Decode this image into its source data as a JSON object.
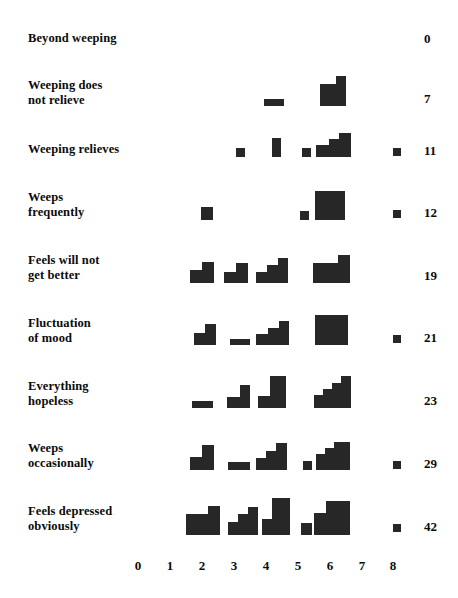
{
  "chart_data": {
    "type": "bar",
    "title": "",
    "subtitle": "",
    "xlabel": "",
    "ylabel": "",
    "xlim": [
      0,
      8
    ],
    "grid": false,
    "legend": null,
    "x_ticks": [
      "0",
      "1",
      "2",
      "3",
      "4",
      "5",
      "6",
      "7",
      "8"
    ],
    "categories": [
      "Beyond weeping",
      "Weeping does not relieve",
      "Weeping relieves",
      "Weeps frequently",
      "Feels will not get better",
      "Fluctuation of mood",
      "Everything hopeless",
      "Weeps occasionally",
      "Feels depressed obviously"
    ],
    "totals": [
      0,
      7,
      11,
      12,
      19,
      21,
      23,
      29,
      42
    ],
    "note": "Each row is a block pictogram: counts of cases plotted as stacked unit squares at integer positions on the 0-8 scale. 'values' below give the count at each x position 0..8 for every row.",
    "series": [
      {
        "name": "Beyond weeping",
        "total": 0,
        "values": [
          0,
          0,
          0,
          0,
          0,
          0,
          0,
          0,
          0
        ]
      },
      {
        "name": "Weeping does not relieve",
        "total": 7,
        "values": [
          0,
          0,
          0,
          0,
          1,
          0,
          2,
          0,
          0
        ]
      },
      {
        "name": "Weeping relieves",
        "total": 11,
        "values": [
          0,
          0,
          1,
          0,
          2,
          1,
          3,
          0,
          0
        ]
      },
      {
        "name": "Weeps frequently",
        "total": 12,
        "values": [
          0,
          0,
          2,
          0,
          0,
          1,
          4,
          0,
          0
        ]
      },
      {
        "name": "Feels will not get better",
        "total": 19,
        "values": [
          0,
          0,
          2,
          2,
          3,
          0,
          3,
          0,
          0
        ]
      },
      {
        "name": "Fluctuation of mood",
        "total": 21,
        "values": [
          0,
          0,
          2,
          1,
          3,
          0,
          4,
          0,
          0
        ]
      },
      {
        "name": "Everything hopeless",
        "total": 23,
        "values": [
          0,
          0,
          1,
          2,
          4,
          0,
          4,
          0,
          0
        ]
      },
      {
        "name": "Weeps occasionally",
        "total": 29,
        "values": [
          0,
          0,
          2,
          1,
          3,
          1,
          4,
          0,
          0
        ]
      },
      {
        "name": "Feels depressed obviously",
        "total": 42,
        "values": [
          0,
          0,
          3,
          2,
          4,
          1,
          4,
          0,
          0
        ]
      }
    ]
  },
  "rows": [
    {
      "label": "Beyond weeping",
      "label_top": 31,
      "label_lines": 1,
      "baseline": 52,
      "total": "0",
      "total_x": 424,
      "total_y": 31,
      "marker": false,
      "stacks": []
    },
    {
      "label": "Weeping does\nnot relieve",
      "label_top": 78,
      "label_lines": 2,
      "baseline": 106,
      "total": "7",
      "total_x": 424,
      "total_y": 91,
      "marker": false,
      "stacks": [
        {
          "x": 264,
          "w": 20,
          "h": 7
        },
        {
          "x": 320,
          "w": 16,
          "h": 22
        },
        {
          "x": 336,
          "w": 10,
          "h": 30
        }
      ]
    },
    {
      "label": "Weeping relieves",
      "label_top": 142,
      "label_lines": 1,
      "baseline": 157,
      "total": "11",
      "total_x": 424,
      "total_y": 143,
      "marker": true,
      "marker_x": 393,
      "marker_y": 148,
      "stacks": [
        {
          "x": 236,
          "w": 9,
          "h": 9
        },
        {
          "x": 272,
          "w": 9,
          "h": 19
        },
        {
          "x": 302,
          "w": 9,
          "h": 9
        },
        {
          "x": 316,
          "w": 13,
          "h": 12
        },
        {
          "x": 329,
          "w": 10,
          "h": 18
        },
        {
          "x": 339,
          "w": 12,
          "h": 24
        }
      ]
    },
    {
      "label": "Weeps\nfrequently",
      "label_top": 190,
      "label_lines": 2,
      "baseline": 220,
      "total": "12",
      "total_x": 424,
      "total_y": 205,
      "marker": true,
      "marker_x": 393,
      "marker_y": 210,
      "stacks": [
        {
          "x": 201,
          "w": 12,
          "h": 13
        },
        {
          "x": 300,
          "w": 9,
          "h": 9
        },
        {
          "x": 315,
          "w": 30,
          "h": 29
        }
      ]
    },
    {
      "label": "Feels will not\nget better",
      "label_top": 253,
      "label_lines": 2,
      "baseline": 283,
      "total": "19",
      "total_x": 424,
      "total_y": 268,
      "marker": false,
      "stacks": [
        {
          "x": 190,
          "w": 12,
          "h": 13
        },
        {
          "x": 202,
          "w": 12,
          "h": 21
        },
        {
          "x": 224,
          "w": 12,
          "h": 11
        },
        {
          "x": 236,
          "w": 12,
          "h": 20
        },
        {
          "x": 256,
          "w": 11,
          "h": 11
        },
        {
          "x": 267,
          "w": 11,
          "h": 18
        },
        {
          "x": 278,
          "w": 10,
          "h": 25
        },
        {
          "x": 313,
          "w": 25,
          "h": 20
        },
        {
          "x": 338,
          "w": 12,
          "h": 28
        }
      ]
    },
    {
      "label": "Fluctuation\nof mood",
      "label_top": 316,
      "label_lines": 2,
      "baseline": 345,
      "total": "21",
      "total_x": 424,
      "total_y": 330,
      "marker": true,
      "marker_x": 393,
      "marker_y": 335,
      "stacks": [
        {
          "x": 194,
          "w": 11,
          "h": 12
        },
        {
          "x": 205,
          "w": 11,
          "h": 21
        },
        {
          "x": 230,
          "w": 20,
          "h": 6
        },
        {
          "x": 256,
          "w": 12,
          "h": 11
        },
        {
          "x": 268,
          "w": 11,
          "h": 17
        },
        {
          "x": 279,
          "w": 10,
          "h": 24
        },
        {
          "x": 315,
          "w": 33,
          "h": 30
        }
      ]
    },
    {
      "label": "Everything\nhopeless",
      "label_top": 379,
      "label_lines": 2,
      "baseline": 408,
      "total": "23",
      "total_x": 424,
      "total_y": 393,
      "marker": false,
      "stacks": [
        {
          "x": 192,
          "w": 21,
          "h": 7
        },
        {
          "x": 227,
          "w": 13,
          "h": 11
        },
        {
          "x": 240,
          "w": 10,
          "h": 23
        },
        {
          "x": 258,
          "w": 12,
          "h": 12
        },
        {
          "x": 270,
          "w": 16,
          "h": 32
        },
        {
          "x": 314,
          "w": 9,
          "h": 13
        },
        {
          "x": 323,
          "w": 9,
          "h": 19
        },
        {
          "x": 332,
          "w": 9,
          "h": 25
        },
        {
          "x": 341,
          "w": 10,
          "h": 32
        }
      ]
    },
    {
      "label": "Weeps\noccasionally",
      "label_top": 441,
      "label_lines": 2,
      "baseline": 470,
      "total": "29",
      "total_x": 424,
      "total_y": 456,
      "marker": true,
      "marker_x": 393,
      "marker_y": 461,
      "stacks": [
        {
          "x": 190,
          "w": 12,
          "h": 13
        },
        {
          "x": 202,
          "w": 12,
          "h": 25
        },
        {
          "x": 228,
          "w": 22,
          "h": 8
        },
        {
          "x": 256,
          "w": 10,
          "h": 12
        },
        {
          "x": 266,
          "w": 10,
          "h": 19
        },
        {
          "x": 276,
          "w": 11,
          "h": 27
        },
        {
          "x": 303,
          "w": 9,
          "h": 9
        },
        {
          "x": 316,
          "w": 9,
          "h": 16
        },
        {
          "x": 325,
          "w": 9,
          "h": 22
        },
        {
          "x": 334,
          "w": 16,
          "h": 28
        }
      ]
    },
    {
      "label": "Feels depressed\nobviously",
      "label_top": 504,
      "label_lines": 2,
      "baseline": 535,
      "total": "42",
      "total_x": 424,
      "total_y": 519,
      "marker": true,
      "marker_x": 393,
      "marker_y": 524,
      "stacks": [
        {
          "x": 186,
          "w": 22,
          "h": 21
        },
        {
          "x": 208,
          "w": 12,
          "h": 29
        },
        {
          "x": 228,
          "w": 10,
          "h": 13
        },
        {
          "x": 238,
          "w": 10,
          "h": 21
        },
        {
          "x": 248,
          "w": 10,
          "h": 28
        },
        {
          "x": 262,
          "w": 10,
          "h": 16
        },
        {
          "x": 272,
          "w": 18,
          "h": 37
        },
        {
          "x": 301,
          "w": 11,
          "h": 12
        },
        {
          "x": 314,
          "w": 12,
          "h": 22
        },
        {
          "x": 326,
          "w": 24,
          "h": 34
        }
      ]
    }
  ],
  "axis": {
    "y": 558,
    "ticks": [
      {
        "label": "0",
        "x": 138
      },
      {
        "label": "1",
        "x": 170
      },
      {
        "label": "2",
        "x": 202
      },
      {
        "label": "3",
        "x": 234
      },
      {
        "label": "4",
        "x": 266
      },
      {
        "label": "5",
        "x": 298
      },
      {
        "label": "6",
        "x": 330
      },
      {
        "label": "7",
        "x": 362
      },
      {
        "label": "8",
        "x": 393
      }
    ]
  },
  "colors": {
    "ink": "#272727",
    "text": "#0b0b0b",
    "background": "#ffffff"
  }
}
